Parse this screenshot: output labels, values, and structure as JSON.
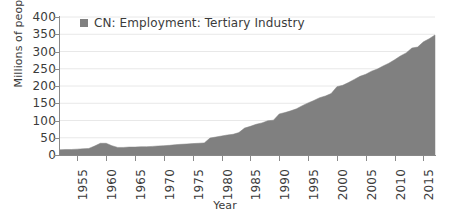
{
  "chart_data": {
    "type": "area",
    "title": "",
    "xlabel": "Year",
    "ylabel": "Millions of people",
    "xlim": [
      1952,
      2017
    ],
    "ylim": [
      0,
      400
    ],
    "grid": true,
    "legend_position": "top-left",
    "series": [
      {
        "name": "CN: Employment: Tertiary Industry",
        "color": "#808080",
        "x": [
          1952,
          1953,
          1954,
          1955,
          1956,
          1957,
          1958,
          1959,
          1960,
          1961,
          1962,
          1963,
          1964,
          1965,
          1966,
          1967,
          1968,
          1969,
          1970,
          1971,
          1972,
          1973,
          1974,
          1975,
          1976,
          1977,
          1978,
          1979,
          1980,
          1981,
          1982,
          1983,
          1984,
          1985,
          1986,
          1987,
          1988,
          1989,
          1990,
          1991,
          1992,
          1993,
          1994,
          1995,
          1996,
          1997,
          1998,
          1999,
          2000,
          2001,
          2002,
          2003,
          2004,
          2005,
          2006,
          2007,
          2008,
          2009,
          2010,
          2011,
          2012,
          2013,
          2014,
          2015,
          2016,
          2017
        ],
        "values": [
          15,
          16,
          16,
          17,
          18,
          19,
          26,
          34,
          34,
          27,
          22,
          22,
          23,
          23,
          24,
          24,
          25,
          26,
          27,
          28,
          30,
          31,
          32,
          33,
          34,
          35,
          49,
          52,
          55,
          58,
          60,
          65,
          78,
          83,
          89,
          93,
          99,
          101,
          119,
          123,
          128,
          134,
          143,
          151,
          158,
          166,
          171,
          178,
          198,
          202,
          210,
          219,
          228,
          234,
          243,
          249,
          258,
          266,
          276,
          287,
          296,
          310,
          313,
          328,
          337,
          348
        ]
      }
    ],
    "y_ticks": [
      0,
      50,
      100,
      150,
      200,
      250,
      300,
      350,
      400
    ],
    "x_ticks": [
      1955,
      1960,
      1965,
      1970,
      1975,
      1980,
      1985,
      1990,
      1995,
      2000,
      2005,
      2010,
      2015
    ]
  },
  "legend": {
    "entries": [
      {
        "label": "CN: Employment: Tertiary Industry",
        "swatch_color": "#808080"
      }
    ]
  },
  "axes": {
    "y_title": "Millions of people",
    "x_title": "Year"
  },
  "colors": {
    "series_fill": "#808080",
    "gridline": "#e8e8e8",
    "axis": "#8a8a8a",
    "text": "#3b3b3b",
    "background": "#ffffff"
  }
}
